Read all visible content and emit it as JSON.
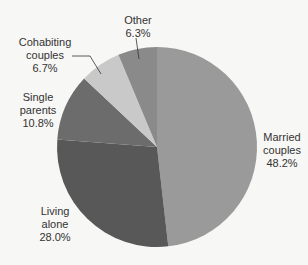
{
  "chart_data": {
    "type": "pie",
    "title": "",
    "slices": [
      {
        "label": "Married couples",
        "value": 48.2,
        "display": "48.2%",
        "color": "#9a9a9a"
      },
      {
        "label": "Living alone",
        "value": 28.0,
        "display": "28.0%",
        "color": "#585858"
      },
      {
        "label": "Single parents",
        "value": 10.8,
        "display": "10.8%",
        "color": "#6c6c6c"
      },
      {
        "label": "Cohabiting couples",
        "value": 6.7,
        "display": "6.7%",
        "color": "#c9c9c9"
      },
      {
        "label": "Other",
        "value": 6.3,
        "display": "6.3%",
        "color": "#8a8a8a"
      }
    ],
    "start_angle_deg": 0,
    "direction": "clockwise"
  },
  "labels": {
    "married": {
      "line1": "Married",
      "line2": "couples",
      "pct": "48.2%"
    },
    "living": {
      "line1": "Living",
      "line2": "alone",
      "pct": "28.0%"
    },
    "single": {
      "line1": "Single",
      "line2": "parents",
      "pct": "10.8%"
    },
    "cohab": {
      "line1": "Cohabiting",
      "line2": "couples",
      "pct": "6.7%"
    },
    "other": {
      "line1": "Other",
      "pct": "6.3%"
    }
  }
}
